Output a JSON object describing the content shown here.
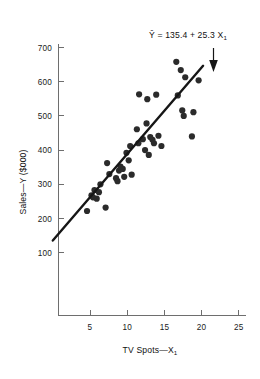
{
  "chart_data": {
    "type": "scatter",
    "title": "",
    "xlabel": "TV Spots—X₁",
    "ylabel": "Sales—Y ($000)",
    "xlim": [
      0,
      26.5
    ],
    "ylim": [
      0,
      755
    ],
    "xticks": [
      5,
      10,
      15,
      20,
      25
    ],
    "xtick_labels": [
      "5",
      "10",
      "15",
      "20",
      "25"
    ],
    "yticks": [
      100,
      200,
      300,
      400,
      500,
      600,
      700
    ],
    "ytick_labels": [
      "100",
      "200",
      "300",
      "400",
      "500",
      "600",
      "700"
    ],
    "grid": false,
    "legend": null,
    "points": [
      [
        4.6,
        222
      ],
      [
        5.2,
        268
      ],
      [
        5.4,
        262
      ],
      [
        5.6,
        283
      ],
      [
        5.9,
        258
      ],
      [
        6.2,
        277
      ],
      [
        6.4,
        300
      ],
      [
        7.1,
        232
      ],
      [
        7.3,
        362
      ],
      [
        7.6,
        330
      ],
      [
        8.5,
        318
      ],
      [
        8.7,
        309
      ],
      [
        8.9,
        340
      ],
      [
        9.1,
        352
      ],
      [
        9.4,
        345
      ],
      [
        9.6,
        322
      ],
      [
        9.9,
        392
      ],
      [
        10.2,
        370
      ],
      [
        10.4,
        412
      ],
      [
        10.6,
        328
      ],
      [
        11.3,
        461
      ],
      [
        11.5,
        420
      ],
      [
        11.6,
        563
      ],
      [
        12.1,
        432
      ],
      [
        12.4,
        400
      ],
      [
        12.6,
        478
      ],
      [
        12.7,
        549
      ],
      [
        12.9,
        386
      ],
      [
        13.1,
        438
      ],
      [
        13.4,
        430
      ],
      [
        13.6,
        420
      ],
      [
        13.9,
        562
      ],
      [
        14.2,
        442
      ],
      [
        14.6,
        412
      ],
      [
        16.6,
        658
      ],
      [
        16.8,
        560
      ],
      [
        17.2,
        634
      ],
      [
        17.4,
        516
      ],
      [
        17.6,
        500
      ],
      [
        17.8,
        613
      ],
      [
        18.7,
        440
      ],
      [
        18.9,
        511
      ],
      [
        19.6,
        604
      ]
    ],
    "regression": {
      "label": "Ŷ = 135.4 + 25.3 X₁",
      "intercept": 135.4,
      "slope": 25.3,
      "x_start": 0,
      "x_end": 20.2
    },
    "annotation": {
      "equation_prefix": "Ŷ = 135.4 + 25.3 X",
      "equation_subscript": "1",
      "arrow": "down-arrow"
    },
    "axis_labels": {
      "x_prefix": "TV Spots—X",
      "x_subscript": "1",
      "y_text": "Sales—Y ($000)"
    }
  }
}
